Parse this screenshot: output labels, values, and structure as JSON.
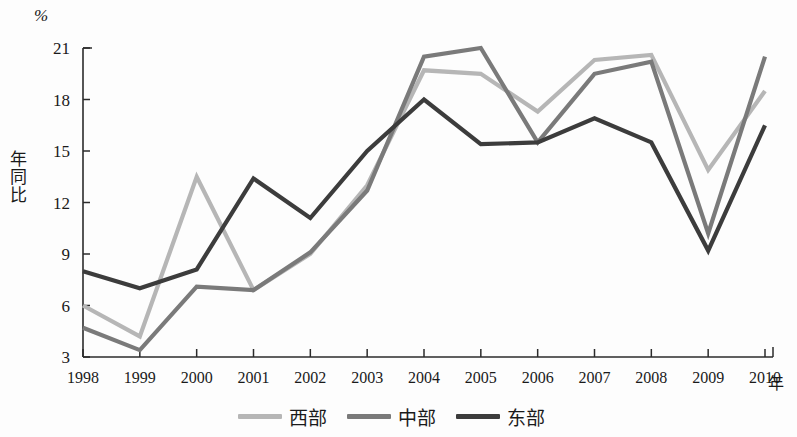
{
  "chart_data": {
    "type": "line",
    "title": "",
    "unit_label": "%",
    "xlabel": "年",
    "ylabel": "年同比",
    "categories": [
      "1998",
      "1999",
      "2000",
      "2001",
      "2002",
      "2003",
      "2004",
      "2005",
      "2006",
      "2007",
      "2008",
      "2009",
      "2010"
    ],
    "x": [
      1998,
      1999,
      2000,
      2001,
      2002,
      2003,
      2004,
      2005,
      2006,
      2007,
      2008,
      2009,
      2010
    ],
    "ylim": [
      3,
      21
    ],
    "yticks": [
      3,
      6,
      9,
      12,
      15,
      18,
      21
    ],
    "xticks": [
      "1998",
      "1999",
      "2000",
      "2001",
      "2002",
      "2003",
      "2004",
      "2005",
      "2006",
      "2007",
      "2008",
      "2009",
      "2010"
    ],
    "grid": false,
    "legend_position": "bottom-center",
    "series": [
      {
        "name": "西部",
        "color": "#b6b6b6",
        "values": [
          6.0,
          4.2,
          13.5,
          6.9,
          9.0,
          13.0,
          19.7,
          19.5,
          17.3,
          20.3,
          20.6,
          13.9,
          18.5
        ]
      },
      {
        "name": "中部",
        "color": "#7a7a7a",
        "values": [
          4.7,
          3.4,
          7.1,
          6.9,
          9.1,
          12.7,
          20.5,
          21.0,
          15.5,
          19.5,
          20.2,
          10.2,
          20.5
        ]
      },
      {
        "name": "东部",
        "color": "#3c3c3c",
        "values": [
          8.0,
          7.0,
          8.1,
          13.4,
          11.1,
          15.0,
          18.0,
          15.4,
          15.5,
          16.9,
          15.5,
          9.2,
          16.5
        ]
      }
    ]
  },
  "legend": {
    "items": [
      {
        "label": "西部",
        "color": "#b6b6b6"
      },
      {
        "label": "中部",
        "color": "#7a7a7a"
      },
      {
        "label": "东部",
        "color": "#3c3c3c"
      }
    ]
  },
  "axis": {
    "unit": "%",
    "y_title": "年同比",
    "x_title": "年",
    "axis_color": "#2b2b2b"
  }
}
